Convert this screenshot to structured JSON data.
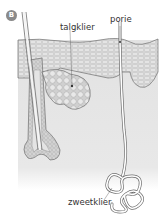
{
  "figure": {
    "badge": "B",
    "labels": {
      "sebaceous_gland": "talgklier",
      "pore": "porie",
      "sweat_gland": "zweetklier"
    },
    "colors": {
      "epidermis": "#d4d4d4",
      "dermis": "#e6e6e6",
      "outline": "#6e6e6e",
      "cells": "#b8b8b8"
    }
  }
}
